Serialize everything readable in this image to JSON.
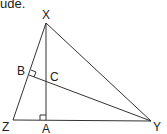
{
  "caption": "ude.",
  "diagram": {
    "vertices": {
      "X": {
        "label": "X",
        "x": 46,
        "y": 23
      },
      "Y": {
        "label": "Y",
        "x": 151,
        "y": 121
      },
      "Z": {
        "label": "Z",
        "x": 13,
        "y": 120
      }
    },
    "points": {
      "A": {
        "label": "A",
        "x": 46,
        "y": 120
      },
      "B": {
        "label": "B",
        "x": 29,
        "y": 75
      },
      "C": {
        "label": "C",
        "x": 46,
        "y": 82
      }
    },
    "segments": [
      "XY",
      "YZ",
      "ZX",
      "XA",
      "YB"
    ],
    "right_angles": [
      "A (XA ⟂ ZY)",
      "B (YB ⟂ ZX)"
    ]
  }
}
